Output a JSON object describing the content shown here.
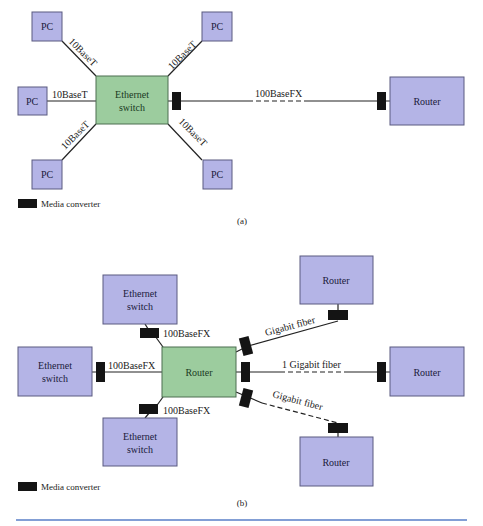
{
  "figure_a": {
    "caption": "(a)",
    "legend_label": "Media converter",
    "switch_label_line1": "Ethernet",
    "switch_label_line2": "switch",
    "router_label": "Router",
    "pc_label": "PC",
    "links": {
      "top_left": "10BaseT",
      "top_right": "10BaseT",
      "left": "10BaseT",
      "bottom_left": "10BaseT",
      "bottom_right": "10BaseT",
      "uplink": "100BaseFX"
    }
  },
  "figure_b": {
    "caption": "(b)",
    "legend_label": "Media converter",
    "core_router_label": "Router",
    "switch_label_line1": "Ethernet",
    "switch_label_line2": "switch",
    "router_label": "Router",
    "links": {
      "top_switch": "100BaseFX",
      "left_switch": "100BaseFX",
      "bottom_switch": "100BaseFX",
      "top_router": "Gigabit fiber",
      "right_router": "1 Gigabit fiber",
      "bottom_router": "Gigabit fiber"
    }
  },
  "colors": {
    "device_blue": "#b4b4e6",
    "device_green": "#9ccc9e",
    "media_converter": "#141414",
    "rule": "#5a7fc7"
  }
}
